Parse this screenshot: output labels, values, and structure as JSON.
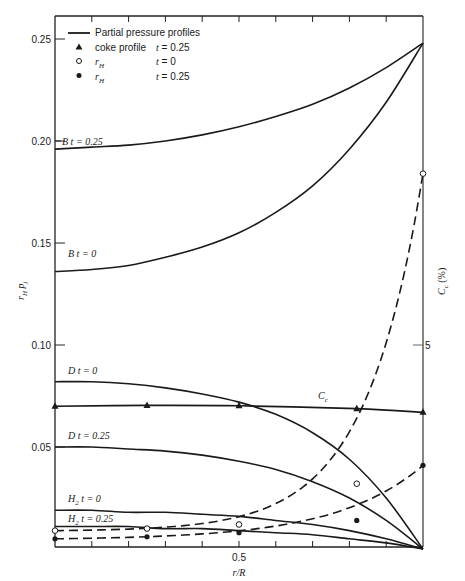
{
  "chart_data": {
    "type": "line",
    "title": "",
    "xlabel": "r/R",
    "ylabel": "r_H   p_j",
    "y2label": "C_c (%)",
    "xlim": [
      0,
      1.0
    ],
    "ylim": [
      0,
      0.25
    ],
    "y2lim": [
      0,
      6.13
    ],
    "x_ticks": [
      0.5
    ],
    "x_tick_labels": [
      "0.5"
    ],
    "y_ticks": [
      0.05,
      0.1,
      0.15,
      0.2,
      0.25
    ],
    "y_tick_labels": [
      "0.05",
      "0.10",
      "0.15",
      "0.20",
      "0.25"
    ],
    "y2_ticks": [
      5
    ],
    "y2_tick_labels": [
      "5"
    ],
    "grid": false,
    "legend": {
      "position": "upper-left",
      "entries": [
        {
          "marker": "line",
          "label": "Partial pressure profiles",
          "time": ""
        },
        {
          "marker": "filled-triangle",
          "label": "coke profile",
          "time": "t = 0.25"
        },
        {
          "marker": "open-circle",
          "label": "r_H",
          "time": "t = 0"
        },
        {
          "marker": "filled-circle",
          "label": "r_H",
          "time": "t = 0.25"
        }
      ]
    },
    "series": [
      {
        "name": "B t = 0.25",
        "label": "B  t = 0.25",
        "style": "solid",
        "axis": "left",
        "x": [
          0,
          0.1,
          0.2,
          0.3,
          0.4,
          0.5,
          0.6,
          0.7,
          0.8,
          0.9,
          1.0
        ],
        "y": [
          0.196,
          0.197,
          0.198,
          0.2,
          0.203,
          0.207,
          0.212,
          0.218,
          0.226,
          0.236,
          0.248
        ]
      },
      {
        "name": "B t = 0",
        "label": "B  t = 0",
        "style": "solid",
        "axis": "left",
        "x": [
          0,
          0.1,
          0.2,
          0.3,
          0.4,
          0.5,
          0.6,
          0.7,
          0.8,
          0.9,
          1.0
        ],
        "y": [
          0.136,
          0.137,
          0.139,
          0.143,
          0.148,
          0.155,
          0.165,
          0.178,
          0.196,
          0.219,
          0.248
        ]
      },
      {
        "name": "D t = 0",
        "label": "D  t = 0",
        "style": "solid",
        "axis": "left",
        "x": [
          0,
          0.1,
          0.2,
          0.3,
          0.4,
          0.5,
          0.6,
          0.7,
          0.8,
          0.9,
          1.0
        ],
        "y": [
          0.082,
          0.082,
          0.081,
          0.079,
          0.076,
          0.072,
          0.066,
          0.057,
          0.044,
          0.025,
          0.0
        ]
      },
      {
        "name": "D t = 0.25",
        "label": "D  t = 0.25",
        "style": "solid",
        "axis": "left",
        "x": [
          0,
          0.1,
          0.2,
          0.3,
          0.4,
          0.5,
          0.6,
          0.7,
          0.8,
          0.9,
          1.0
        ],
        "y": [
          0.05,
          0.05,
          0.049,
          0.048,
          0.046,
          0.043,
          0.039,
          0.033,
          0.025,
          0.014,
          0.0
        ]
      },
      {
        "name": "H2 t = 0",
        "label": "H2  t = 0",
        "style": "solid",
        "axis": "left",
        "x": [
          0,
          0.1,
          0.2,
          0.3,
          0.4,
          0.5,
          0.6,
          0.7,
          0.8,
          0.9,
          1.0
        ],
        "y": [
          0.019,
          0.019,
          0.018,
          0.018,
          0.017,
          0.016,
          0.014,
          0.012,
          0.009,
          0.005,
          0.0
        ]
      },
      {
        "name": "H2 t = 0.25",
        "label": "H2  t = 0.25",
        "style": "solid",
        "axis": "left",
        "x": [
          0,
          0.1,
          0.2,
          0.3,
          0.4,
          0.5,
          0.6,
          0.7,
          0.8,
          0.9,
          1.0
        ],
        "y": [
          0.011,
          0.011,
          0.011,
          0.01,
          0.01,
          0.009,
          0.008,
          0.007,
          0.005,
          0.003,
          0.0
        ]
      },
      {
        "name": "r_H t = 0",
        "label": "",
        "style": "dashed",
        "marker": "open-circle",
        "axis": "left",
        "x": [
          0,
          0.25,
          0.5,
          0.82,
          1.0
        ],
        "y": [
          0.009,
          0.01,
          0.012,
          0.032,
          0.184
        ]
      },
      {
        "name": "r_H t = 0.25",
        "label": "",
        "style": "dashed",
        "marker": "filled-circle",
        "axis": "left",
        "x": [
          0,
          0.25,
          0.5,
          0.82,
          1.0
        ],
        "y": [
          0.005,
          0.006,
          0.008,
          0.014,
          0.041
        ]
      },
      {
        "name": "coke profile t = 0.25",
        "label": "C_c",
        "style": "solid",
        "marker": "filled-triangle",
        "axis": "right",
        "x": [
          0,
          0.25,
          0.5,
          0.82,
          1.0
        ],
        "y": [
          3.5,
          3.52,
          3.51,
          3.44,
          3.35
        ]
      }
    ]
  },
  "labels": {
    "y_axis_left": "r",
    "y_axis_left_sub": "H",
    "y_axis_left_p": "p",
    "y_axis_left_p_sub": "j",
    "y_axis_right": "C",
    "y_axis_right_sub": "c",
    "y_axis_right_unit": "(%)",
    "x_axis": "r/R",
    "cc_curve": "C",
    "cc_curve_sub": "c"
  }
}
